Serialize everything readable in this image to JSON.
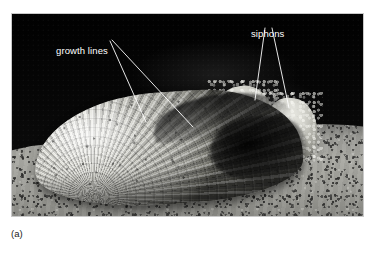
{
  "figure": {
    "caption": "(a)",
    "photo_style": "black-and-white-photograph"
  },
  "annotations": [
    {
      "id": "growth-lines",
      "label": "growth lines",
      "leader_count": 2,
      "points_to": "concentric-ridges-on-shell-valve"
    },
    {
      "id": "siphons",
      "label": "siphons",
      "leader_count": 2,
      "points_to": "paired-fringed-siphon-tubes"
    }
  ],
  "scene": {
    "background_label": "dark water background",
    "substrate_label": "sand",
    "organism_label": "clam shell"
  },
  "colors": {
    "page_background": "#ffffff",
    "photo_background": "#050505",
    "sand_light": "#a9a9a3",
    "sand_dark": "#6f6f6c",
    "shell_highlight": "#f2f2ee",
    "shell_shadow": "#4c4c46",
    "annotation_text": "#ffffff",
    "annotation_leader": "#ffffff",
    "caption_text": "#1a1a1a"
  }
}
